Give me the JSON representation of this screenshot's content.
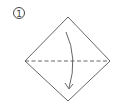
{
  "step": {
    "number": "1"
  },
  "diagram": {
    "shape": "square-diamond",
    "fold_line": "valley-fold-horizontal",
    "arrow": "fold-down",
    "colors": {
      "stroke": "#555555",
      "background": "#ffffff"
    }
  }
}
